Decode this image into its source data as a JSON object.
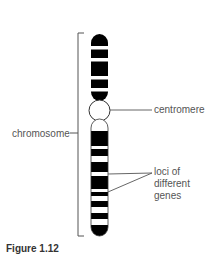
{
  "diagram": {
    "type": "chromosome-structure",
    "labels": {
      "chromosome": "chromosome",
      "centromere": "centromere",
      "loci_line1": "loci of",
      "loci_line2": "different",
      "loci_line3": "genes"
    },
    "caption": "Figure 1.12",
    "colors": {
      "band_dark": "#000000",
      "band_light": "#ffffff",
      "outline": "#333333",
      "leader_line": "#555555",
      "text": "#555555"
    }
  }
}
